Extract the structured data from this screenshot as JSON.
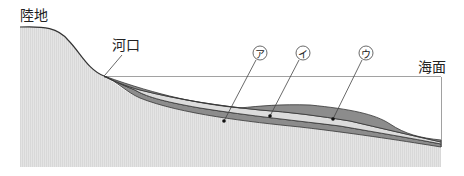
{
  "labels": {
    "land": "陸地",
    "river_mouth": "河口",
    "sea_surface": "海面"
  },
  "markers": [
    {
      "id": "a",
      "text": "ア"
    },
    {
      "id": "i",
      "text": "イ"
    },
    {
      "id": "u",
      "text": "ウ"
    }
  ],
  "colors": {
    "land_fill": "#e2e2e2",
    "layer_dark": "#8a8a8a",
    "layer_light": "#dcdcdc",
    "line": "#333333"
  }
}
